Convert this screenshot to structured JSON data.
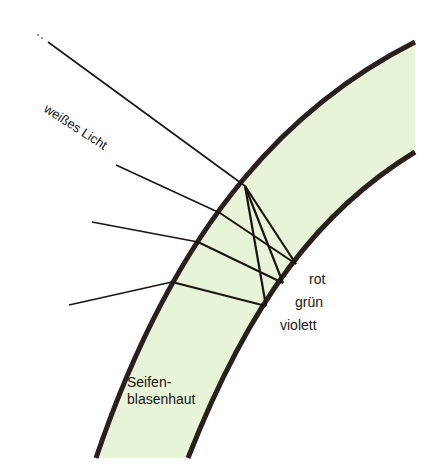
{
  "diagram": {
    "colors": {
      "film_fill": "#e8f4d8",
      "film_border": "#2a1f1c",
      "ray": "#1a1512",
      "background": "#ffffff"
    },
    "labels": {
      "incident_light": "weißes Licht",
      "red": "rot",
      "green": "grün",
      "violet": "violett",
      "film": "Seifen-\nblasenhaut",
      "film_line1": "Seifen-",
      "film_line2": "blasenhaut"
    },
    "geometry": {
      "incident_ray": {
        "from": [
          35,
          92
        ],
        "to": [
          245,
          186
        ]
      },
      "entry_point": [
        245,
        186
      ],
      "internal_rays": [
        {
          "color": "rot",
          "to": [
            296,
            264
          ]
        },
        {
          "color": "grün",
          "to": [
            283,
            283
          ]
        },
        {
          "color": "violett",
          "to": [
            266,
            306
          ]
        }
      ],
      "reflected_rays": [
        {
          "color": "rot",
          "from": [
            296,
            264
          ],
          "exit": [
            220,
            213
          ],
          "out": [
            116,
            165
          ]
        },
        {
          "color": "grün",
          "from": [
            283,
            283
          ],
          "exit": [
            198,
            242
          ],
          "out": [
            92,
            222
          ]
        },
        {
          "color": "violett",
          "from": [
            266,
            306
          ],
          "exit": [
            172,
            282
          ],
          "out": [
            69,
            305
          ]
        }
      ]
    }
  }
}
